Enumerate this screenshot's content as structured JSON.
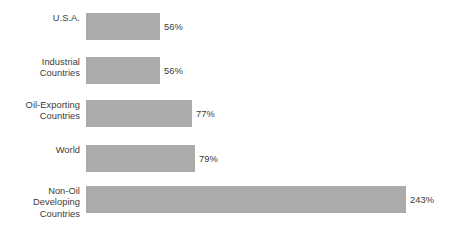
{
  "chart_data": {
    "type": "bar",
    "orientation": "horizontal",
    "title": "",
    "subtitle": "",
    "xlabel": "",
    "ylabel": "",
    "grid": false,
    "legend": false,
    "axis_visible": false,
    "value_suffix": "%",
    "categories": [
      "U.S.A.",
      "Industrial\nCountries",
      "Oil-Exporting\nCountries",
      "World",
      "Non-Oil\nDeveloping\nCountries"
    ],
    "values": [
      56,
      56,
      77,
      79,
      243
    ],
    "value_labels": [
      "56%",
      "56%",
      "77%",
      "79%",
      "243%"
    ],
    "xlim": [
      0,
      243
    ],
    "bar_color": "#ababab",
    "text_color": "#3b3b3b",
    "background_color": "#ffffff",
    "bar_pixel_widths": [
      74,
      74,
      106,
      109,
      320
    ],
    "bar_pixel_tops": [
      13,
      57,
      100,
      145,
      186
    ],
    "bar_pixel_height": 27,
    "bar_origin_x": 86
  }
}
